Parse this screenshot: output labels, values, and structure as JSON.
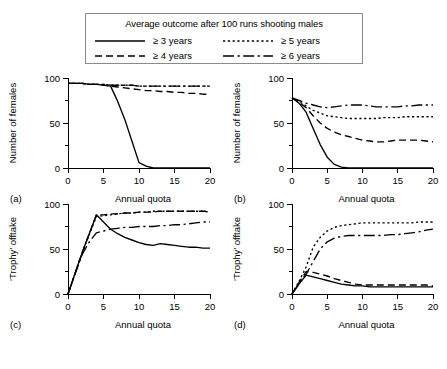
{
  "legend": {
    "title": "Average outcome after 100 runs shooting males",
    "entries": [
      {
        "label": "≥ 3 years",
        "style": "solid"
      },
      {
        "label": "≥ 5 years",
        "style": "dotted"
      },
      {
        "label": "≥ 4 years",
        "style": "dashed"
      },
      {
        "label": "≥ 6 years",
        "style": "dashdot"
      }
    ]
  },
  "axes": {
    "x_label": "Annual quota",
    "x_ticks": [
      "0",
      "5",
      "10",
      "15",
      "20"
    ],
    "y_ticks_females": [
      "0",
      "50",
      "100"
    ],
    "y_ticks_trophy": [
      "0",
      "50",
      "100"
    ],
    "y_label_females": "Number of females",
    "y_label_trophy": "‘Trophy’ offtake"
  },
  "panels": [
    {
      "letter": "(a)",
      "y_label": "Number of females",
      "x_label": "Annual quota"
    },
    {
      "letter": "(b)",
      "y_label": "Number of females",
      "x_label": "Annual quota"
    },
    {
      "letter": "(c)",
      "y_label": "‘Trophy’ offtake",
      "x_label": "Annual quota"
    },
    {
      "letter": "(d)",
      "y_label": "‘Trophy’ offtake",
      "x_label": "Annual quota"
    }
  ],
  "chart_data": [
    {
      "id": "a",
      "type": "line",
      "title": "(a)",
      "xlabel": "Annual quota",
      "ylabel": "Number of females",
      "xlim": [
        0,
        20
      ],
      "ylim": [
        0,
        100
      ],
      "xticks": [
        0,
        5,
        10,
        15,
        20
      ],
      "yticks": [
        0,
        50,
        100
      ],
      "grid": false,
      "legend": "top-shared",
      "x": [
        0,
        1,
        2,
        3,
        4,
        5,
        6,
        7,
        8,
        9,
        10,
        11,
        12,
        13,
        14,
        15,
        16,
        17,
        18,
        19,
        20
      ],
      "series": [
        {
          "name": "≥ 3 years",
          "style": "solid",
          "values": [
            94,
            94,
            94,
            93,
            93,
            92,
            91,
            74,
            54,
            30,
            6,
            2,
            0,
            0,
            0,
            0,
            0,
            0,
            0,
            0,
            0
          ]
        },
        {
          "name": "≥ 4 years",
          "style": "dashed",
          "values": [
            94,
            94,
            94,
            93,
            93,
            92,
            91,
            90,
            89,
            88,
            87,
            86,
            86,
            85,
            85,
            84,
            84,
            83,
            83,
            82,
            82
          ]
        },
        {
          "name": "≥ 5 years",
          "style": "dotted",
          "values": [
            94,
            94,
            94,
            93,
            93,
            93,
            92,
            92,
            92,
            92,
            91,
            91,
            91,
            91,
            91,
            91,
            91,
            91,
            91,
            91,
            91
          ]
        },
        {
          "name": "≥ 6 years",
          "style": "dashdot",
          "values": [
            94,
            94,
            94,
            93,
            93,
            93,
            92,
            92,
            92,
            92,
            91,
            91,
            91,
            91,
            91,
            91,
            91,
            91,
            91,
            91,
            91
          ]
        }
      ]
    },
    {
      "id": "b",
      "type": "line",
      "title": "(b)",
      "xlabel": "Annual quota",
      "ylabel": "Number of females",
      "xlim": [
        0,
        20
      ],
      "ylim": [
        0,
        100
      ],
      "xticks": [
        0,
        5,
        10,
        15,
        20
      ],
      "yticks": [
        0,
        50,
        100
      ],
      "grid": false,
      "legend": "top-shared",
      "x": [
        0,
        1,
        2,
        3,
        4,
        5,
        6,
        7,
        8,
        9,
        10,
        11,
        12,
        13,
        14,
        15,
        16,
        17,
        18,
        19,
        20
      ],
      "series": [
        {
          "name": "≥ 3 years",
          "style": "solid",
          "values": [
            78,
            72,
            62,
            44,
            26,
            12,
            4,
            1,
            0,
            0,
            0,
            0,
            0,
            0,
            0,
            0,
            0,
            0,
            0,
            0,
            0
          ]
        },
        {
          "name": "≥ 4 years",
          "style": "dashed",
          "values": [
            78,
            73,
            67,
            58,
            50,
            44,
            40,
            37,
            35,
            33,
            31,
            30,
            29,
            29,
            30,
            31,
            31,
            31,
            31,
            30,
            29
          ]
        },
        {
          "name": "≥ 5 years",
          "style": "dotted",
          "values": [
            78,
            74,
            69,
            64,
            61,
            58,
            57,
            56,
            55,
            55,
            55,
            55,
            55,
            56,
            56,
            56,
            57,
            57,
            57,
            57,
            57
          ]
        },
        {
          "name": "≥ 6 years",
          "style": "dashdot",
          "values": [
            78,
            75,
            72,
            70,
            68,
            67,
            68,
            69,
            70,
            70,
            70,
            69,
            68,
            68,
            68,
            68,
            69,
            69,
            70,
            70,
            70
          ]
        }
      ]
    },
    {
      "id": "c",
      "type": "line",
      "title": "(c)",
      "xlabel": "Annual quota",
      "ylabel": "‘Trophy’ offtake",
      "xlim": [
        0,
        20
      ],
      "ylim": [
        0,
        100
      ],
      "xticks": [
        0,
        5,
        10,
        15,
        20
      ],
      "yticks": [
        0,
        50,
        100
      ],
      "grid": false,
      "legend": "top-shared",
      "x": [
        0,
        1,
        2,
        3,
        4,
        5,
        6,
        7,
        8,
        9,
        10,
        11,
        12,
        13,
        14,
        15,
        16,
        17,
        18,
        19,
        20
      ],
      "series": [
        {
          "name": "≥ 3 years",
          "style": "solid",
          "values": [
            0,
            23,
            46,
            67,
            88,
            80,
            72,
            67,
            63,
            60,
            57,
            55,
            54,
            56,
            55,
            54,
            53,
            52,
            52,
            51,
            51
          ]
        },
        {
          "name": "≥ 4 years",
          "style": "dashed",
          "values": [
            0,
            23,
            46,
            67,
            88,
            88,
            89,
            89,
            90,
            90,
            91,
            91,
            91,
            92,
            92,
            92,
            92,
            92,
            92,
            92,
            92
          ]
        },
        {
          "name": "≥ 5 years",
          "style": "dotted",
          "values": [
            0,
            23,
            46,
            66,
            86,
            87,
            88,
            89,
            90,
            90,
            91,
            91,
            92,
            92,
            92,
            92,
            92,
            92,
            92,
            92,
            91
          ]
        },
        {
          "name": "≥ 6 years",
          "style": "dashdot",
          "values": [
            0,
            22,
            44,
            58,
            68,
            70,
            72,
            73,
            74,
            74,
            75,
            75,
            75,
            76,
            76,
            77,
            77,
            78,
            79,
            80,
            80
          ]
        }
      ]
    },
    {
      "id": "d",
      "type": "line",
      "title": "(d)",
      "xlabel": "Annual quota",
      "ylabel": "‘Trophy’ offtake",
      "xlim": [
        0,
        20
      ],
      "ylim": [
        0,
        100
      ],
      "xticks": [
        0,
        5,
        10,
        15,
        20
      ],
      "yticks": [
        0,
        50,
        100
      ],
      "grid": false,
      "legend": "top-shared",
      "x": [
        0,
        1,
        2,
        3,
        4,
        5,
        6,
        7,
        8,
        9,
        10,
        11,
        12,
        13,
        14,
        15,
        16,
        17,
        18,
        19,
        20
      ],
      "series": [
        {
          "name": "≥ 3 years",
          "style": "solid",
          "values": [
            0,
            11,
            21,
            19,
            17,
            15,
            13,
            11,
            10,
            9,
            9,
            8,
            8,
            8,
            8,
            8,
            8,
            8,
            8,
            8,
            8
          ]
        },
        {
          "name": "≥ 4 years",
          "style": "dashed",
          "values": [
            0,
            13,
            25,
            24,
            22,
            20,
            17,
            15,
            13,
            11,
            10,
            10,
            10,
            10,
            10,
            10,
            10,
            10,
            10,
            10,
            9
          ]
        },
        {
          "name": "≥ 5 years",
          "style": "dotted",
          "values": [
            0,
            14,
            30,
            52,
            63,
            70,
            74,
            76,
            77,
            78,
            79,
            79,
            79,
            79,
            79,
            79,
            79,
            79,
            80,
            80,
            80
          ]
        },
        {
          "name": "≥ 6 years",
          "style": "dashdot",
          "values": [
            0,
            12,
            22,
            36,
            50,
            58,
            62,
            64,
            65,
            65,
            65,
            65,
            65,
            65,
            66,
            66,
            67,
            68,
            69,
            71,
            72
          ]
        }
      ]
    }
  ]
}
